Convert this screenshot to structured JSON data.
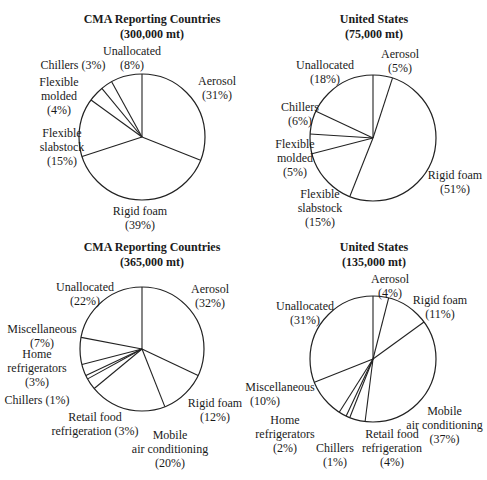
{
  "chart_data": [
    {
      "type": "pie",
      "title": "CMA Reporting Countries",
      "subtitle": "(300,000 mt)",
      "categories": [
        "Aerosol",
        "Rigid foam",
        "Flexible slabstock",
        "Flexible molded",
        "Chillers",
        "Unallocated"
      ],
      "values": [
        31,
        39,
        15,
        4,
        3,
        8
      ]
    },
    {
      "type": "pie",
      "title": "United States",
      "subtitle": "(75,000 mt)",
      "categories": [
        "Aerosol",
        "Rigid foam",
        "Flexible slabstock",
        "Flexible molded",
        "Chillers",
        "Unallocated"
      ],
      "values": [
        5,
        51,
        15,
        5,
        6,
        18
      ]
    },
    {
      "type": "pie",
      "title": "CMA Reporting Countries",
      "subtitle": "(365,000 mt)",
      "categories": [
        "Aerosol",
        "Rigid foam",
        "Mobile air conditioning",
        "Retail food refrigeration",
        "Chillers",
        "Home refrigerators",
        "Miscellaneous",
        "Unallocated"
      ],
      "values": [
        32,
        12,
        20,
        3,
        1,
        3,
        7,
        22
      ]
    },
    {
      "type": "pie",
      "title": "United States",
      "subtitle": "(135,000 mt)",
      "categories": [
        "Aerosol",
        "Rigid foam",
        "Mobile air conditioning",
        "Retail food refrigeration",
        "Chillers",
        "Home refrigerators",
        "Miscellaneous",
        "Unallocated"
      ],
      "values": [
        4,
        11,
        37,
        4,
        1,
        2,
        10,
        31
      ]
    }
  ],
  "labels": {
    "c1": {
      "title": "CMA Reporting Countries",
      "sub": "(300,000 mt)",
      "aerosol": "Aerosol",
      "aerosol_p": "(31%)",
      "rigid": "Rigid foam",
      "rigid_p": "(39%)",
      "slab1": "Flexible",
      "slab2": "slabstock",
      "slab_p": "(15%)",
      "mold1": "Flexible",
      "mold2": "molded",
      "mold_p": "(4%)",
      "chill": "Chillers (3%)",
      "unal": "Unallocated",
      "unal_p": "(8%)"
    },
    "c2": {
      "title": "United States",
      "sub": "(75,000 mt)",
      "aerosol": "Aerosol",
      "aerosol_p": "(5%)",
      "rigid": "Rigid foam",
      "rigid_p": "(51%)",
      "slab1": "Flexible",
      "slab2": "slabstock",
      "slab_p": "(15%)",
      "mold1": "Flexible",
      "mold2": "molded",
      "mold_p": "(5%)",
      "chill": "Chillers",
      "chill_p": "(6%)",
      "unal": "Unallocated",
      "unal_p": "(18%)"
    },
    "c3": {
      "title": "CMA Reporting Countries",
      "sub": "(365,000 mt)",
      "aerosol": "Aerosol",
      "aerosol_p": "(32%)",
      "rigid": "Rigid foam",
      "rigid_p": "(12%)",
      "mac1": "Mobile",
      "mac2": "air conditioning",
      "mac_p": "(20%)",
      "retail1": "Retail food",
      "retail2": "refrigeration (3%)",
      "chill": "Chillers (1%)",
      "home1": "Home",
      "home2": "refrigerators",
      "home_p": "(3%)",
      "misc": "Miscellaneous",
      "misc_p": "(7%)",
      "unal": "Unallocated",
      "unal_p": "(22%)"
    },
    "c4": {
      "title": "United States",
      "sub": "(135,000 mt)",
      "aerosol": "Aerosol",
      "aerosol_p": "(4%)",
      "rigid": "Rigid foam",
      "rigid_p": "(11%)",
      "mac1": "Mobile",
      "mac2": "air conditioning",
      "mac_p": "(37%)",
      "retail1": "Retail food",
      "retail2": "refrigeration",
      "retail_p": "(4%)",
      "chill": "Chillers",
      "chill_p": "(1%)",
      "home1": "Home",
      "home2": "refrigerators",
      "home_p": "(2%)",
      "misc": "Miscellaneous",
      "misc_p": "(10%)",
      "unal": "Unallocated",
      "unal_p": "(31%)"
    }
  }
}
